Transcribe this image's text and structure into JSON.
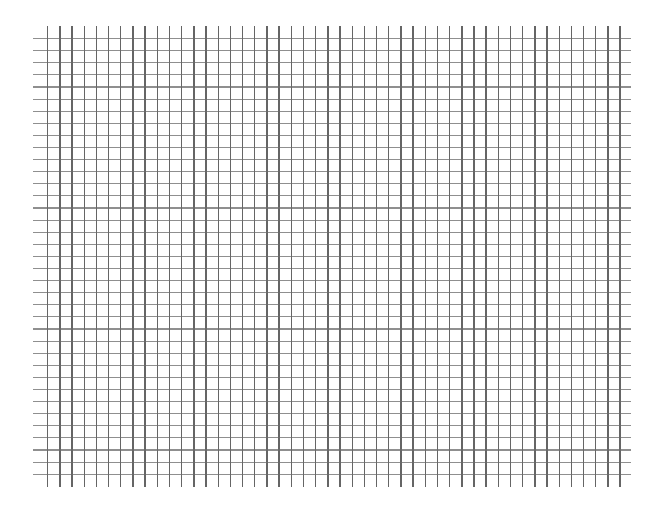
{
  "grid": {
    "description": "hand-drawn style square grid paper",
    "line_color_vertical": "#4a4a4a",
    "line_color_horizontal": "#6a6a6a",
    "background": "#ffffff",
    "vertical": {
      "count": 48,
      "x_start": 47,
      "spacing": 12.18,
      "y_top": 26,
      "y_bottom": 487
    },
    "horizontal": {
      "count": 37,
      "y_start": 38,
      "spacing": 12.1,
      "x_left": 33,
      "x_right": 631
    }
  }
}
